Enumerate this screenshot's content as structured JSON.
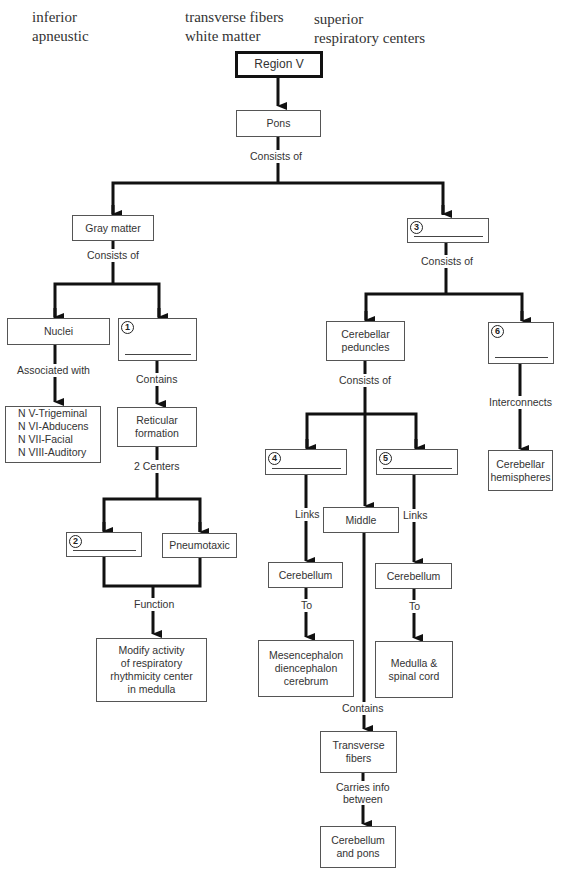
{
  "word_bank": {
    "column1": [
      "inferior",
      "apneustic"
    ],
    "column2": [
      "transverse fibers",
      "white matter"
    ],
    "column3": [
      "superior",
      "respiratory centers"
    ]
  },
  "nodes": {
    "region": "Region V",
    "pons": "Pons",
    "gray_matter": "Gray matter",
    "blank3": {
      "number": "3",
      "answer": ""
    },
    "nuclei": "Nuclei",
    "blank1": {
      "number": "1",
      "answer": ""
    },
    "cranial_nerves": [
      "N V-Trigeminal",
      "N VI-Abducens",
      "N VII-Facial",
      "N VIII-Auditory"
    ],
    "reticular_formation": [
      "Reticular",
      "formation"
    ],
    "blank2": {
      "number": "2",
      "answer": ""
    },
    "pneumotaxic": "Pneumotaxic",
    "function_result": [
      "Modify activity",
      "of respiratory",
      "rhythmicity center",
      "in medulla"
    ],
    "cerebellar_peduncles": [
      "Cerebellar",
      "peduncles"
    ],
    "blank6": {
      "number": "6",
      "answer": ""
    },
    "cerebellar_hemispheres": [
      "Cerebellar",
      "hemispheres"
    ],
    "blank4": {
      "number": "4",
      "answer": ""
    },
    "blank5": {
      "number": "5",
      "answer": ""
    },
    "middle": "Middle",
    "cerebellum_left": "Cerebellum",
    "cerebellum_right": "Cerebellum",
    "mesencephalon": [
      "Mesencephalon",
      "diencephalon",
      "cerebrum"
    ],
    "medulla_spinal": [
      "Medulla &",
      "spinal cord"
    ],
    "transverse_fibers": [
      "Transverse",
      "fibers"
    ],
    "cerebellum_pons": [
      "Cerebellum",
      "and pons"
    ]
  },
  "edge_labels": {
    "pons_consists": "Consists of",
    "gray_consists": "Consists of",
    "blank3_consists": "Consists of",
    "nuclei_assoc": "Associated with",
    "blank1_contains": "Contains",
    "reticular_centers": "2 Centers",
    "function": "Function",
    "peduncles_consists": "Consists of",
    "interconnects": "Interconnects",
    "links_left": "Links",
    "links_right": "Links",
    "to_left": "To",
    "to_right": "To",
    "middle_contains": "Contains",
    "carries_info": [
      "Carries info",
      "between"
    ]
  }
}
